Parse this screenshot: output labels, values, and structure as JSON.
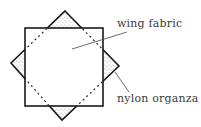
{
  "diagram": {
    "labels": {
      "wing_fabric": "wing fabric",
      "nylon_organza": "nylon organza"
    },
    "colors": {
      "stroke": "#1a1a1a",
      "label": "#3a3a3a",
      "stipple": "#555555",
      "background": "#ffffff"
    },
    "shapes": {
      "square": {
        "x": 25,
        "y": 28,
        "width": 78,
        "height": 78
      },
      "diamond": {
        "top": [
          65,
          11
        ],
        "right": [
          119,
          66
        ],
        "bottom": [
          62,
          120
        ],
        "left": [
          11,
          63
        ]
      }
    }
  }
}
